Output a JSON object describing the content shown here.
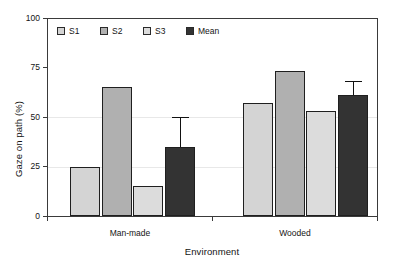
{
  "chart_data": {
    "type": "bar",
    "title": "",
    "xlabel": "Environment",
    "ylabel": "Gaze on path (%)",
    "categories": [
      "Man-made",
      "Wooded"
    ],
    "ylim": [
      0,
      100
    ],
    "yticks": [
      0,
      25,
      50,
      75,
      100
    ],
    "ytick_labels": [
      "0",
      "25",
      "50",
      "75",
      "100"
    ],
    "grid": false,
    "legend_position": "top-left inside axes",
    "series": [
      {
        "name": "S1",
        "color": "#d4d4d4",
        "values": [
          25,
          57
        ],
        "errors": [
          null,
          null
        ]
      },
      {
        "name": "S2",
        "color": "#b0b0b0",
        "values": [
          65,
          73
        ],
        "errors": [
          null,
          null
        ]
      },
      {
        "name": "S3",
        "color": "#dcdcdc",
        "values": [
          15,
          53
        ],
        "errors": [
          null,
          null
        ]
      },
      {
        "name": "Mean",
        "color": "#333333",
        "values": [
          35,
          61
        ],
        "errors": [
          15,
          7
        ]
      }
    ]
  },
  "axes": {
    "y_title": "Gaze on path (%)",
    "x_title": "Environment",
    "y_ticks": [
      "100",
      "75",
      "50",
      "25",
      "0"
    ],
    "x_categories": [
      "Man-made",
      "Wooded"
    ]
  },
  "legend": {
    "items": [
      {
        "label": "S1",
        "color": "#d4d4d4"
      },
      {
        "label": "S2",
        "color": "#b0b0b0"
      },
      {
        "label": "S3",
        "color": "#dcdcdc"
      },
      {
        "label": "Mean",
        "color": "#333333"
      }
    ]
  }
}
